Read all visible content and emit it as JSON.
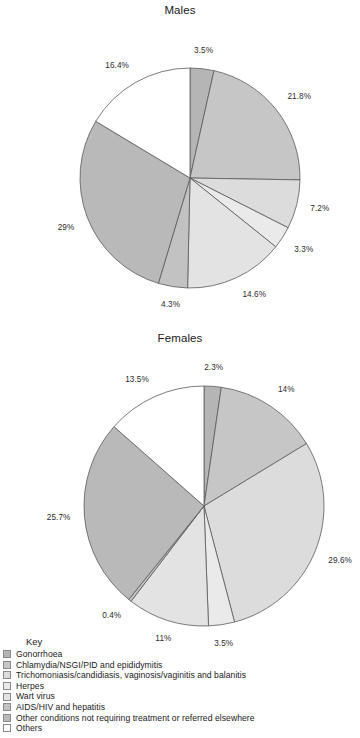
{
  "legend": {
    "title": "Key",
    "items": [
      {
        "label": "Gonorrhoea",
        "color": "#b5b5b5"
      },
      {
        "label": "Chlamydia/NSGI/PID and epididymitis",
        "color": "#c6c6c6"
      },
      {
        "label": "Trichomoniasis/candidiasis, vaginosis/vaginitis and balanitis",
        "color": "#dcdcdc"
      },
      {
        "label": "Herpes",
        "color": "#eaeaea"
      },
      {
        "label": "Wart virus",
        "color": "#e3e3e3"
      },
      {
        "label": "AIDS/HIV and hepatitis",
        "color": "#c2c2c2"
      },
      {
        "label": "Other conditions not requiring treatment or referred elsewhere",
        "color": "#b9b9b9"
      },
      {
        "label": "Others",
        "color": "#ffffff"
      }
    ]
  },
  "chart_data": [
    {
      "type": "pie",
      "title": "Males",
      "xlabel": "",
      "ylabel": "",
      "start_angle": 0,
      "direction": "clockwise",
      "categories": [
        "Gonorrhoea",
        "Chlamydia/NSGI/PID and epididymitis",
        "Trichomoniasis/candidiasis, vaginosis/vaginitis and balanitis",
        "Herpes",
        "Wart virus",
        "AIDS/HIV and hepatitis",
        "Other conditions not requiring treatment or referred elsewhere",
        "Others"
      ],
      "values": [
        3.5,
        21.8,
        7.2,
        3.3,
        14.6,
        4.3,
        29,
        16.4
      ],
      "labels": [
        "3.5%",
        "21.8%",
        "7.2%",
        "3.3%",
        "14.6%",
        "4.3%",
        "29%",
        "16.4%"
      ],
      "colors": [
        "#b5b5b5",
        "#c6c6c6",
        "#dcdcdc",
        "#eaeaea",
        "#e3e3e3",
        "#c2c2c2",
        "#b9b9b9",
        "#ffffff"
      ]
    },
    {
      "type": "pie",
      "title": "Females",
      "xlabel": "",
      "ylabel": "",
      "start_angle": 0,
      "direction": "clockwise",
      "categories": [
        "Gonorrhoea",
        "Chlamydia/NSGI/PID and epididymitis",
        "Trichomoniasis/candidiasis, vaginosis/vaginitis and balanitis",
        "Herpes",
        "Wart virus",
        "AIDS/HIV and hepatitis",
        "Other conditions not requiring treatment or referred elsewhere",
        "Others"
      ],
      "values": [
        2.3,
        14,
        29.6,
        3.5,
        11,
        0.4,
        25.7,
        13.5
      ],
      "labels": [
        "2.3%",
        "14%",
        "29.6%",
        "3.5%",
        "11%",
        "0.4%",
        "25.7%",
        "13.5%"
      ],
      "colors": [
        "#b5b5b5",
        "#c6c6c6",
        "#dcdcdc",
        "#eaeaea",
        "#e3e3e3",
        "#c2c2c2",
        "#b9b9b9",
        "#ffffff"
      ]
    }
  ],
  "geometry": {
    "males": {
      "cx": 190,
      "cy": 178,
      "r": 110,
      "label_r": 124
    },
    "females": {
      "cx": 204,
      "cy": 176,
      "r": 120,
      "label_r": 134
    }
  }
}
